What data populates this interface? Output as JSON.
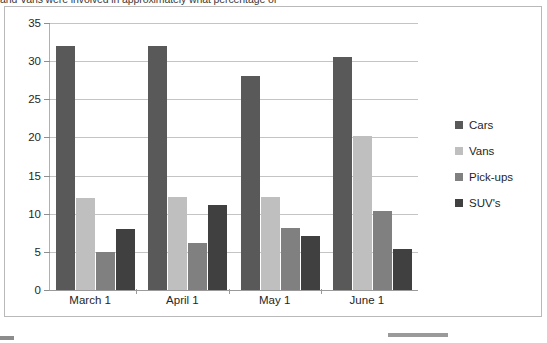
{
  "question": {
    "text": "and Vans were involved in approximately what percentage of"
  },
  "chart_data": {
    "type": "bar",
    "title": "",
    "xlabel": "",
    "ylabel": "",
    "categories": [
      "March 1",
      "April 1",
      "May 1",
      "June 1"
    ],
    "ylim": [
      0,
      35
    ],
    "yticks": [
      0,
      5,
      10,
      15,
      20,
      25,
      30,
      35
    ],
    "grid": true,
    "legend_position": "right",
    "series": [
      {
        "name": "Cars",
        "color": "#595959",
        "values": [
          32,
          32,
          28,
          30.5
        ]
      },
      {
        "name": "Vans",
        "color": "#bfbfbf",
        "values": [
          12,
          12.2,
          12.2,
          20.2
        ]
      },
      {
        "name": "Pick-ups",
        "color": "#808080",
        "values": [
          5,
          6.1,
          8.1,
          10.4
        ]
      },
      {
        "name": "SUV's",
        "color": "#404040",
        "values": [
          8,
          11.1,
          7.1,
          5.4
        ]
      }
    ]
  },
  "legend": {
    "items": [
      {
        "label": "Cars",
        "color": "#595959"
      },
      {
        "label": "Vans",
        "color": "#bfbfbf"
      },
      {
        "label": "Pick-ups",
        "color": "#808080"
      },
      {
        "label": "SUV's",
        "color": "#404040"
      }
    ]
  }
}
